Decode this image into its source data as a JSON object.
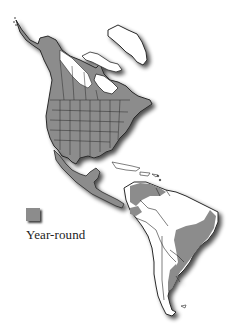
{
  "map": {
    "type": "range-map",
    "region": "Americas",
    "colors": {
      "range_fill": "#8c8c8c",
      "land_fill": "#ffffff",
      "border": "#2a2a2a",
      "shadow": "#555555"
    }
  },
  "legend": {
    "items": [
      {
        "label": "Year-round",
        "color": "#8c8c8c"
      }
    ]
  }
}
